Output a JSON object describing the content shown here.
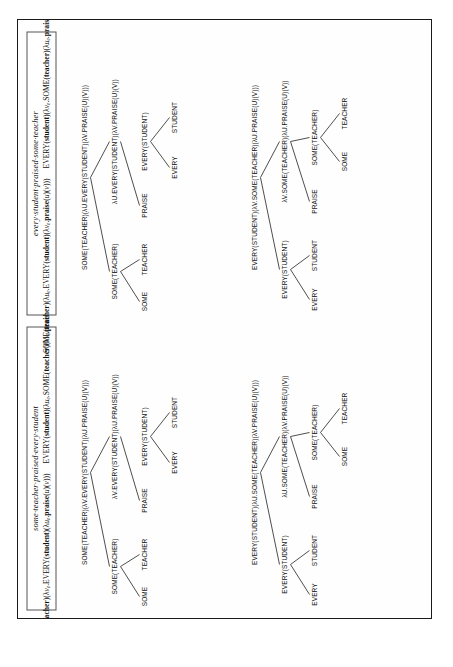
{
  "figure": {
    "orientation": "rotated-90-ccw",
    "blocks": [
      {
        "title": "some·teacher·praised·every·student",
        "formula_left_html": "SOME(<b>teacher</b>)(λ<i>v</i><span class=\"sub\">e</span>.EVERY(<b>student</b>)(λ<i>u</i><span class=\"sub\">e</span>.<b>praise</b>(<i>u</i>)(<i>v</i>)))",
        "formula_right_html": "EVERY(<b>student</b>)(λ<i>u</i><span class=\"sub\">e</span>.SOME(<b>teacher</b>)(λ<i>v</i><span class=\"sub\">e</span>.<b>praise</b>(<i>u</i>)(<i>v</i>)))",
        "trees": [
          {
            "name": "tree-some-over-every",
            "levels": [
              [
                {
                  "label": "SOME(TEACHER)(λV.EVERY(STUDENT)(λU.PRAISE(U)(V)))",
                  "x": 140
                }
              ],
              [
                {
                  "label": "SOME(TEACHER)",
                  "x": 46
                },
                {
                  "label": "λV.EVERY(STUDENT)(λU.PRAISE(U)(V))",
                  "x": 176
                }
              ],
              [
                {
                  "label": "SOME",
                  "x": 16
                },
                {
                  "label": "TEACHER",
                  "x": 58
                },
                {
                  "label": "PRAISE",
                  "x": 112
                },
                {
                  "label": "EVERY(STUDENT)",
                  "x": 176
                }
              ],
              [
                {
                  "label": "EVERY",
                  "x": 150
                },
                {
                  "label": "STUDENT",
                  "x": 200
                }
              ]
            ],
            "edges": [
              {
                "from": 140,
                "to": 46,
                "level": 0
              },
              {
                "from": 140,
                "to": 176,
                "level": 0
              },
              {
                "from": 46,
                "to": 16,
                "level": 1
              },
              {
                "from": 46,
                "to": 58,
                "level": 1
              },
              {
                "from": 176,
                "to": 112,
                "level": 1
              },
              {
                "from": 176,
                "to": 176,
                "level": 1
              },
              {
                "from": 176,
                "to": 150,
                "level": 2
              },
              {
                "from": 176,
                "to": 200,
                "level": 2
              }
            ]
          },
          {
            "name": "tree-every-over-some",
            "levels": [
              [
                {
                  "label": "EVERY(STUDENT)(λU.SOME(TEACHER)(λV.PRAISE(U)(V)))",
                  "x": 140
                }
              ],
              [
                {
                  "label": "EVERY(STUDENT)",
                  "x": 48
                },
                {
                  "label": "λU.SOME(TEACHER)(λV.PRAISE(U)(V))",
                  "x": 176
                }
              ],
              [
                {
                  "label": "EVERY",
                  "x": 18
                },
                {
                  "label": "STUDENT",
                  "x": 62
                },
                {
                  "label": "PRAISE",
                  "x": 116
                },
                {
                  "label": "SOME(TEACHER)",
                  "x": 180
                }
              ],
              [
                {
                  "label": "SOME",
                  "x": 156
                },
                {
                  "label": "TEACHER",
                  "x": 204
                }
              ]
            ],
            "edges": [
              {
                "from": 140,
                "to": 48,
                "level": 0
              },
              {
                "from": 140,
                "to": 176,
                "level": 0
              },
              {
                "from": 48,
                "to": 18,
                "level": 1
              },
              {
                "from": 48,
                "to": 62,
                "level": 1
              },
              {
                "from": 176,
                "to": 116,
                "level": 1
              },
              {
                "from": 176,
                "to": 180,
                "level": 1
              },
              {
                "from": 180,
                "to": 156,
                "level": 2
              },
              {
                "from": 180,
                "to": 204,
                "level": 2
              }
            ]
          }
        ]
      },
      {
        "title": "every·student·praised·some·teacher",
        "formula_left_html": "SOME(<b>teacher</b>)(λ<i>u</i><span class=\"sub\">e</span>.EVERY(<b>student</b>)(λ<i>v</i><span class=\"sub\">e</span>.<b>praise</b>(<i>u</i>)(<i>v</i>)))",
        "formula_right_html": "EVERY(<b>student</b>)(λ<i>v</i><span class=\"sub\">e</span>.SOME(<b>teacher</b>)(λ<i>u</i><span class=\"sub\">e</span>.<b>praise</b>(<i>u</i>)(<i>v</i>)))",
        "trees": [
          {
            "name": "tree-some-over-every-2",
            "levels": [
              [
                {
                  "label": "SOME(TEACHER)(λU.EVERY(STUDENT)(λV.PRAISE(U)(V)))",
                  "x": 140
                }
              ],
              [
                {
                  "label": "SOME(TEACHER)",
                  "x": 46
                },
                {
                  "label": "λU.EVERY(STUDENT)(λV.PRAISE(U)(V))",
                  "x": 176
                }
              ],
              [
                {
                  "label": "SOME",
                  "x": 16
                },
                {
                  "label": "TEACHER",
                  "x": 58
                },
                {
                  "label": "PRAISE",
                  "x": 112
                },
                {
                  "label": "EVERY(STUDENT)",
                  "x": 176
                }
              ],
              [
                {
                  "label": "EVERY",
                  "x": 150
                },
                {
                  "label": "STUDENT",
                  "x": 200
                }
              ]
            ],
            "edges": [
              {
                "from": 140,
                "to": 46,
                "level": 0
              },
              {
                "from": 140,
                "to": 176,
                "level": 0
              },
              {
                "from": 46,
                "to": 16,
                "level": 1
              },
              {
                "from": 46,
                "to": 58,
                "level": 1
              },
              {
                "from": 176,
                "to": 112,
                "level": 1
              },
              {
                "from": 176,
                "to": 176,
                "level": 1
              },
              {
                "from": 176,
                "to": 150,
                "level": 2
              },
              {
                "from": 176,
                "to": 200,
                "level": 2
              }
            ]
          },
          {
            "name": "tree-every-over-some-2",
            "levels": [
              [
                {
                  "label": "EVERY(STUDENT)(λV.SOME(TEACHER)(λU.PRAISE(U)(V)))",
                  "x": 140
                }
              ],
              [
                {
                  "label": "EVERY(STUDENT)",
                  "x": 48
                },
                {
                  "label": "λV.SOME(TEACHER)(λU.PRAISE(U)(V))",
                  "x": 176
                }
              ],
              [
                {
                  "label": "EVERY",
                  "x": 18
                },
                {
                  "label": "STUDENT",
                  "x": 62
                },
                {
                  "label": "PRAISE",
                  "x": 116
                },
                {
                  "label": "SOME(TEACHER)",
                  "x": 180
                }
              ],
              [
                {
                  "label": "SOME",
                  "x": 156
                },
                {
                  "label": "TEACHER",
                  "x": 204
                }
              ]
            ],
            "edges": [
              {
                "from": 140,
                "to": 48,
                "level": 0
              },
              {
                "from": 140,
                "to": 176,
                "level": 0
              },
              {
                "from": 48,
                "to": 18,
                "level": 1
              },
              {
                "from": 48,
                "to": 62,
                "level": 1
              },
              {
                "from": 176,
                "to": 116,
                "level": 1
              },
              {
                "from": 176,
                "to": 180,
                "level": 1
              },
              {
                "from": 180,
                "to": 156,
                "level": 2
              },
              {
                "from": 180,
                "to": 204,
                "level": 2
              }
            ]
          }
        ]
      }
    ]
  },
  "colors": {
    "ink": "#111111",
    "rule": "#3a3a3a",
    "frame": "#1a1a1a",
    "paper": "#fefefe"
  }
}
